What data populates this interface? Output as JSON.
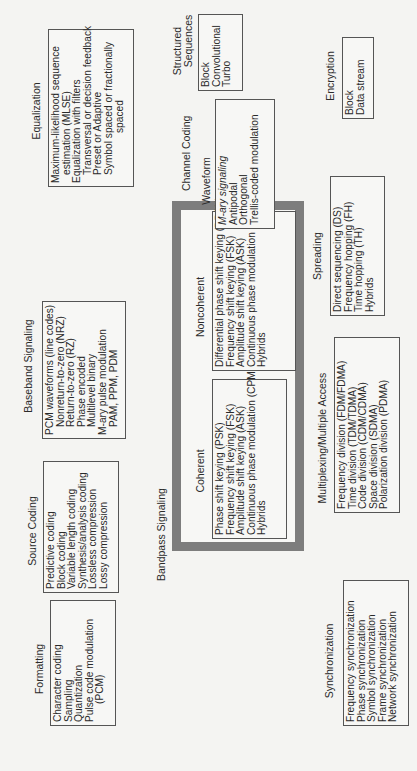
{
  "diagram": {
    "formatting": {
      "title": "Formatting",
      "items": [
        "Character coding",
        "Sampling",
        "Quantization",
        "Pulse code modulation",
        "(PCM)"
      ]
    },
    "source_coding": {
      "title": "Source Coding",
      "items": [
        "Predictive coding",
        "Block coding",
        "Variable length coding",
        "Synthesis/analysis coding",
        "Lossless compression",
        "Lossy compression"
      ]
    },
    "baseband_signaling": {
      "title": "Baseband Signaling",
      "items": [
        "PCM waveforms (line codes)",
        "Nonreturn-to-zero (NRZ)",
        "Return-to-zero (RZ)",
        "Phase encoded",
        "Multilevel binary",
        "M-ary pulse modulation",
        "PAM, PPM, PDM"
      ]
    },
    "equalization": {
      "title": "Equalization",
      "items": [
        "Maximum-likelihood sequence",
        "estimation (MLSE)",
        "Equalization with filters",
        "Transversal or decision feedback",
        "Preset or Adaptive",
        "Symbol spaced or fractionally",
        "spaced"
      ]
    },
    "bandpass_signaling": {
      "title": "Bandpass Signaling",
      "coherent": {
        "title": "Coherent",
        "items": [
          "Phase shift keying (PSK)",
          "Frequency shift keying (FSK)",
          "Amplitude shift keying (ASK)",
          "Continuous phase modulation (CPM)",
          "Hybrids"
        ]
      },
      "noncoherent": {
        "title": "Noncoherent",
        "items": [
          "Differential phase shift keying (DPSK)",
          "Frequency shift keying (FSK)",
          "Amplitude shift keying (ASK)",
          "Continuous phase modulation (CPM)",
          "Hybrids"
        ]
      }
    },
    "channel_coding": {
      "title": "Channel Coding",
      "waveform": {
        "title": "Waveform",
        "items": [
          "M-ary signaling",
          "Antipodal",
          "Orthogonal",
          "Trellis-coded modulation"
        ]
      },
      "structured_sequences": {
        "title_line1": "Structured",
        "title_line2": "Sequences",
        "items": [
          "Block",
          "Convolutional",
          "Turbo"
        ]
      }
    },
    "synchronization": {
      "title": "Synchronization",
      "items": [
        "Frequency synchronization",
        "Phase synchronization",
        "Symbol synchronization",
        "Frame synchronization",
        "Network synchronization"
      ]
    },
    "multiplexing": {
      "title": "Multiplexing/Multiple Access",
      "items": [
        "Frequency division (FDM/FDMA)",
        "Time division (TDM/TDMA)",
        "Code division (CDM/CDMA)",
        "Space division (SDMA)",
        "Polarization division (PDMA)"
      ]
    },
    "spreading": {
      "title": "Spreading",
      "items": [
        "Direct sequencing (DS)",
        "Frequency hopping (FH)",
        "Time hopping (TH)",
        "Hybrids"
      ]
    },
    "encryption": {
      "title": "Encryption",
      "items": [
        "Block",
        "Data stream"
      ]
    }
  },
  "colors": {
    "background": "#f4f4f2",
    "box_border": "#555555",
    "bandpass_frame": "#7d7d7d",
    "text": "#2a2a2a"
  }
}
